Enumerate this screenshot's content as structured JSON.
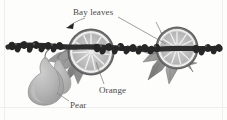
{
  "figure": {
    "type": "labeled-illustration",
    "background_color": "#fdfdfc",
    "palette": {
      "garland_dark": "#2b2b2b",
      "garland_mid": "#555555",
      "orange_rind": "#6e6e6e",
      "orange_flesh": "#bdbdbd",
      "orange_pith": "#e6e6e6",
      "leaf_light": "#a8a8a8",
      "leaf_dark": "#7d7d7d",
      "pear_fill": "#b5b5b5",
      "pear_shade": "#9a9a9a",
      "label_text": "#4a4a4a",
      "leader_line": "#777777",
      "frame_line": "#eeeeee"
    }
  },
  "labels": {
    "bay_leaves": "Bay leaves",
    "orange": "Orange",
    "pear": "Pear"
  },
  "callouts": [
    {
      "id": "bay-leaves",
      "text": "Bay leaves",
      "label_position": {
        "x": 73,
        "y": 8
      },
      "pointers": [
        {
          "kind": "arrow",
          "from": {
            "x": 84,
            "y": 18
          },
          "to": {
            "x": 68,
            "y": 27
          }
        },
        {
          "kind": "line",
          "from": {
            "x": 118,
            "y": 17
          },
          "to": {
            "x": 166,
            "y": 44
          }
        }
      ]
    },
    {
      "id": "orange",
      "text": "Orange",
      "label_position": {
        "x": 99,
        "y": 86
      },
      "pointers": [
        {
          "kind": "curve",
          "from": {
            "x": 104,
            "y": 84
          },
          "to": {
            "x": 96,
            "y": 62
          }
        }
      ]
    },
    {
      "id": "pear",
      "text": "Pear",
      "label_position": {
        "x": 70,
        "y": 101
      },
      "pointers": [
        {
          "kind": "line",
          "from": {
            "x": 69,
            "y": 101
          },
          "to": {
            "x": 57,
            "y": 93
          }
        }
      ]
    }
  ],
  "elements": {
    "orange_slices": [
      {
        "id": "orange-slice-left",
        "center": {
          "x": 91,
          "y": 52
        },
        "radius": 23,
        "segments": 11
      },
      {
        "id": "orange-slice-right",
        "center": {
          "x": 177,
          "y": 48
        },
        "radius": 21,
        "segments": 11
      }
    ],
    "pears": [
      {
        "id": "pear-front",
        "center": {
          "x": 42,
          "y": 85
        }
      },
      {
        "id": "pear-back",
        "center": {
          "x": 54,
          "y": 76
        }
      }
    ],
    "bay_leaf_clusters": [
      {
        "id": "bay-cluster-left",
        "center": {
          "x": 70,
          "y": 60
        },
        "leaves": 5
      },
      {
        "id": "bay-cluster-right",
        "center": {
          "x": 163,
          "y": 57
        },
        "leaves": 7
      }
    ],
    "garland_rope": {
      "id": "garland-rope",
      "description": "dark textured cranberry/berry strand running horizontally across the scene"
    }
  }
}
